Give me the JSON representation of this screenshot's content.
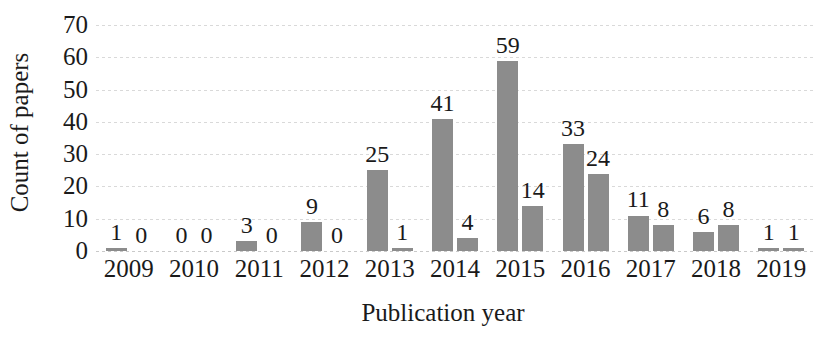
{
  "chart_data": {
    "type": "bar",
    "title": "",
    "xlabel": "Publication year",
    "ylabel": "Count of papers",
    "categories": [
      "2009",
      "2010",
      "2011",
      "2012",
      "2013",
      "2014",
      "2015",
      "2016",
      "2017",
      "2018",
      "2019"
    ],
    "series": [
      {
        "name": "series-1",
        "values": [
          1,
          0,
          3,
          9,
          25,
          41,
          59,
          33,
          11,
          6,
          1
        ]
      },
      {
        "name": "series-2",
        "values": [
          0,
          0,
          0,
          0,
          1,
          4,
          14,
          24,
          8,
          8,
          1
        ]
      }
    ],
    "value_labels": {
      "2009": [
        "1",
        "0"
      ],
      "2010": [
        "0",
        "0"
      ],
      "2011": [
        "3",
        "0"
      ],
      "2012": [
        "9",
        "0"
      ],
      "2013": [
        "25",
        "1"
      ],
      "2014": [
        "41",
        "4"
      ],
      "2015": [
        "59",
        "14"
      ],
      "2016": [
        "33",
        "24"
      ],
      "2017": [
        "11",
        "8"
      ],
      "2018": [
        "6",
        "8"
      ],
      "2019": [
        "1",
        "1"
      ]
    },
    "yticks": [
      "0",
      "10",
      "20",
      "30",
      "40",
      "50",
      "60",
      "70"
    ],
    "ylim": [
      0,
      70
    ],
    "grid": true,
    "legend": "none",
    "bar_color": "#8c8c8c",
    "gridline_color": "#d9d9d9",
    "text_color": "#1a1a1a",
    "background_color": "#ffffff"
  }
}
